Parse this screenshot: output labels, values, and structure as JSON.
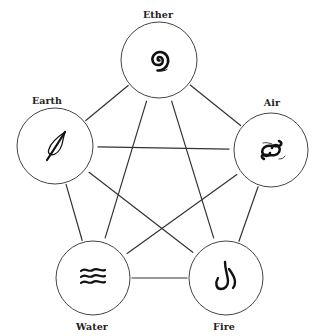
{
  "diagram": {
    "type": "five-elements-pentagram",
    "nodes": [
      {
        "id": "ether",
        "label": "Ether",
        "icon": "spiral-icon",
        "cx": 159,
        "cy": 60,
        "r": 38,
        "label_x": 158,
        "label_y": 14
      },
      {
        "id": "earth",
        "label": "Earth",
        "icon": "leaf-icon",
        "cx": 55,
        "cy": 146,
        "r": 38,
        "label_x": 47,
        "label_y": 100
      },
      {
        "id": "air",
        "label": "Air",
        "icon": "wind-swirl-icon",
        "cx": 271,
        "cy": 150,
        "r": 37,
        "label_x": 272,
        "label_y": 102
      },
      {
        "id": "water",
        "label": "Water",
        "icon": "waves-icon",
        "cx": 93,
        "cy": 278,
        "r": 37,
        "label_x": 92,
        "label_y": 326
      },
      {
        "id": "fire",
        "label": "Fire",
        "icon": "flame-icon",
        "cx": 226,
        "cy": 278,
        "r": 37,
        "label_x": 224,
        "label_y": 326
      }
    ],
    "edges_outer_pentagon": [
      [
        "ether",
        "earth"
      ],
      [
        "ether",
        "air"
      ],
      [
        "earth",
        "water"
      ],
      [
        "air",
        "fire"
      ],
      [
        "water",
        "fire"
      ]
    ],
    "edges_inner_star": [
      [
        "ether",
        "water"
      ],
      [
        "ether",
        "fire"
      ],
      [
        "earth",
        "air"
      ],
      [
        "earth",
        "fire"
      ],
      [
        "air",
        "water"
      ]
    ],
    "colors": {
      "background": "#ffffff",
      "line": "#333333",
      "circle_stroke": "#444444",
      "glyph": "#111111",
      "label": "#222222"
    }
  }
}
